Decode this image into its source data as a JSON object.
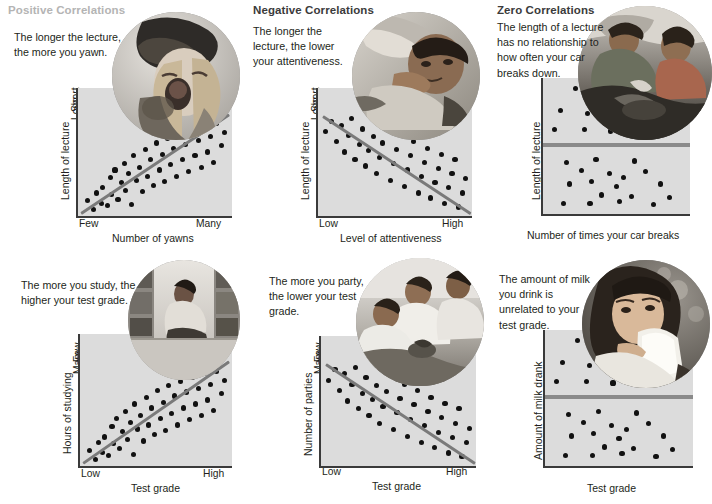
{
  "headings": [
    {
      "id": "positive",
      "label": "Positive Correlations",
      "tone": "faded"
    },
    {
      "id": "negative",
      "label": "Negative Correlations",
      "tone": "dark"
    },
    {
      "id": "zero",
      "label": "Zero Correlations",
      "tone": "dark"
    }
  ],
  "panels": [
    {
      "id": "positive-lecture-yawn",
      "heading": "Positive Correlations",
      "caption": "The longer the lecture, the more you yawn.",
      "photo_alt": "woman yawning wearing a knit hat",
      "chart": {
        "type": "scatter",
        "xlabel": "Number of yawns",
        "ylabel": "Length of lecture",
        "xticks": [
          "Few",
          "Many"
        ],
        "yticks": [
          "Short",
          "Long"
        ],
        "trend": "positive",
        "trend_line": {
          "x1": 0.02,
          "y1": 0.03,
          "x2": 0.98,
          "y2": 0.8
        }
      }
    },
    {
      "id": "negative-lecture-attentiveness",
      "heading": "Negative Correlations",
      "caption": "The longer the lecture, the lower your attentiveness.",
      "photo_alt": "student asleep on desk in class",
      "chart": {
        "type": "scatter",
        "xlabel": "Level of attentiveness",
        "ylabel": "Length of lecture",
        "xticks": [
          "Low",
          "High"
        ],
        "yticks": [
          "Short",
          "Long"
        ],
        "trend": "negative",
        "trend_line": {
          "x1": 0.03,
          "y1": 0.79,
          "x2": 0.99,
          "y2": 0.03
        }
      }
    },
    {
      "id": "zero-lecture-car",
      "heading": "Zero Correlations",
      "caption": "The length of a lecture has no relationship to how often your car breaks down.",
      "photo_alt": "two people repairing a car engine",
      "chart": {
        "type": "scatter",
        "xlabel": "Number of times your car breaks",
        "ylabel": "Length of lecture",
        "xticks": [],
        "yticks": [],
        "trend": "zero",
        "trend_line": {
          "y": 0.52
        }
      }
    },
    {
      "id": "positive-study-grade",
      "heading": "Positive Correlations",
      "caption": "The more you study, the higher your test grade.",
      "photo_alt": "student reading in a library aisle",
      "chart": {
        "type": "scatter",
        "xlabel": "Test grade",
        "ylabel": "Hours of studying",
        "xticks": [
          "Low",
          "High"
        ],
        "yticks": [
          "Few",
          "Many"
        ],
        "trend": "positive",
        "trend_line": {
          "x1": 0.02,
          "y1": 0.03,
          "x2": 0.98,
          "y2": 0.8
        }
      }
    },
    {
      "id": "negative-party-grade",
      "heading": "Negative Correlations",
      "caption": "The more you party, the lower your test grade.",
      "photo_alt": "three friends at a party",
      "chart": {
        "type": "scatter",
        "xlabel": "Test grade",
        "ylabel": "Number of parties",
        "xticks": [
          "Low",
          "High"
        ],
        "yticks": [
          "Few",
          "Many"
        ],
        "trend": "negative",
        "trend_line": {
          "x1": 0.03,
          "y1": 0.79,
          "x2": 0.99,
          "y2": 0.03
        }
      }
    },
    {
      "id": "zero-milk-grade",
      "heading": "Zero Correlations",
      "caption": "The amount of milk you drink is unrelated to your test grade.",
      "photo_alt": "woman drinking a glass of milk",
      "chart": {
        "type": "scatter",
        "xlabel": "Test grade",
        "ylabel": "Amount of milk drank",
        "xticks": [],
        "yticks": [],
        "trend": "zero",
        "trend_line": {
          "y": 0.52
        }
      }
    }
  ],
  "colors": {
    "plot_background": "#dcdcdc",
    "axis": "#3a3a3a",
    "dot": "#111111",
    "trend_line": "#7a7a7a",
    "heading_dark": "#3b3b3b",
    "heading_faded": "#b4b4b4",
    "text": "#231f20"
  },
  "chart_data": [
    {
      "id": "positive-lecture-yawn",
      "type": "scatter",
      "title": "Positive Correlations",
      "xlabel": "Number of yawns",
      "ylabel": "Length of lecture",
      "xticklabels": [
        "Few",
        "Many"
      ],
      "yticklabels": [
        "Short",
        "Long"
      ],
      "xlim": [
        0,
        1
      ],
      "ylim": [
        0,
        1
      ],
      "grid": false,
      "trendline": {
        "type": "positive",
        "points": [
          [
            0.02,
            0.03
          ],
          [
            0.98,
            0.8
          ]
        ]
      },
      "points": [
        [
          0.06,
          0.12
        ],
        [
          0.1,
          0.05
        ],
        [
          0.12,
          0.18
        ],
        [
          0.15,
          0.1
        ],
        [
          0.16,
          0.22
        ],
        [
          0.19,
          0.08
        ],
        [
          0.21,
          0.3
        ],
        [
          0.22,
          0.17
        ],
        [
          0.24,
          0.36
        ],
        [
          0.26,
          0.13
        ],
        [
          0.28,
          0.26
        ],
        [
          0.3,
          0.41
        ],
        [
          0.31,
          0.2
        ],
        [
          0.33,
          0.33
        ],
        [
          0.35,
          0.09
        ],
        [
          0.36,
          0.47
        ],
        [
          0.38,
          0.28
        ],
        [
          0.4,
          0.38
        ],
        [
          0.42,
          0.19
        ],
        [
          0.44,
          0.52
        ],
        [
          0.45,
          0.31
        ],
        [
          0.47,
          0.44
        ],
        [
          0.49,
          0.24
        ],
        [
          0.51,
          0.57
        ],
        [
          0.53,
          0.36
        ],
        [
          0.55,
          0.48
        ],
        [
          0.56,
          0.27
        ],
        [
          0.58,
          0.61
        ],
        [
          0.6,
          0.4
        ],
        [
          0.62,
          0.53
        ],
        [
          0.64,
          0.31
        ],
        [
          0.66,
          0.64
        ],
        [
          0.68,
          0.44
        ],
        [
          0.7,
          0.56
        ],
        [
          0.72,
          0.35
        ],
        [
          0.74,
          0.67
        ],
        [
          0.76,
          0.47
        ],
        [
          0.78,
          0.59
        ],
        [
          0.8,
          0.38
        ],
        [
          0.82,
          0.7
        ],
        [
          0.84,
          0.5
        ],
        [
          0.86,
          0.62
        ],
        [
          0.88,
          0.42
        ],
        [
          0.9,
          0.72
        ],
        [
          0.93,
          0.55
        ],
        [
          0.95,
          0.65
        ]
      ]
    },
    {
      "id": "negative-lecture-attentiveness",
      "type": "scatter",
      "title": "Negative Correlations",
      "xlabel": "Level of attentiveness",
      "ylabel": "Length of lecture",
      "xticklabels": [
        "Low",
        "High"
      ],
      "yticklabels": [
        "Short",
        "Long"
      ],
      "xlim": [
        0,
        1
      ],
      "ylim": [
        0,
        1
      ],
      "grid": false,
      "trendline": {
        "type": "negative",
        "points": [
          [
            0.03,
            0.79
          ],
          [
            0.99,
            0.03
          ]
        ]
      },
      "points": [
        [
          0.05,
          0.66
        ],
        [
          0.09,
          0.74
        ],
        [
          0.12,
          0.58
        ],
        [
          0.15,
          0.71
        ],
        [
          0.17,
          0.5
        ],
        [
          0.2,
          0.63
        ],
        [
          0.22,
          0.76
        ],
        [
          0.24,
          0.44
        ],
        [
          0.27,
          0.56
        ],
        [
          0.29,
          0.68
        ],
        [
          0.31,
          0.39
        ],
        [
          0.33,
          0.51
        ],
        [
          0.36,
          0.62
        ],
        [
          0.38,
          0.33
        ],
        [
          0.4,
          0.46
        ],
        [
          0.42,
          0.57
        ],
        [
          0.45,
          0.7
        ],
        [
          0.47,
          0.28
        ],
        [
          0.49,
          0.41
        ],
        [
          0.51,
          0.52
        ],
        [
          0.54,
          0.63
        ],
        [
          0.56,
          0.23
        ],
        [
          0.58,
          0.36
        ],
        [
          0.6,
          0.47
        ],
        [
          0.62,
          0.58
        ],
        [
          0.65,
          0.18
        ],
        [
          0.67,
          0.31
        ],
        [
          0.69,
          0.42
        ],
        [
          0.71,
          0.53
        ],
        [
          0.73,
          0.14
        ],
        [
          0.76,
          0.26
        ],
        [
          0.78,
          0.37
        ],
        [
          0.8,
          0.48
        ],
        [
          0.82,
          0.1
        ],
        [
          0.85,
          0.22
        ],
        [
          0.87,
          0.33
        ],
        [
          0.89,
          0.44
        ],
        [
          0.91,
          0.07
        ],
        [
          0.94,
          0.18
        ],
        [
          0.96,
          0.29
        ]
      ]
    },
    {
      "id": "zero-lecture-car",
      "type": "scatter",
      "title": "Zero Correlations",
      "xlabel": "Number of times your car breaks",
      "ylabel": "Length of lecture",
      "xticklabels": [],
      "yticklabels": [],
      "xlim": [
        0,
        1
      ],
      "ylim": [
        0,
        1
      ],
      "grid": false,
      "trendline": {
        "type": "zero",
        "y": 0.52
      },
      "points": [
        [
          0.08,
          0.62
        ],
        [
          0.22,
          0.92
        ],
        [
          0.12,
          0.76
        ],
        [
          0.3,
          0.74
        ],
        [
          0.28,
          0.62
        ],
        [
          0.46,
          0.61
        ],
        [
          0.16,
          0.38
        ],
        [
          0.36,
          0.4
        ],
        [
          0.26,
          0.32
        ],
        [
          0.45,
          0.3
        ],
        [
          0.62,
          0.39
        ],
        [
          0.55,
          0.27
        ],
        [
          0.18,
          0.22
        ],
        [
          0.33,
          0.24
        ],
        [
          0.5,
          0.2
        ],
        [
          0.7,
          0.31
        ],
        [
          0.4,
          0.14
        ],
        [
          0.6,
          0.13
        ],
        [
          0.8,
          0.22
        ],
        [
          0.14,
          0.08
        ],
        [
          0.32,
          0.08
        ],
        [
          0.52,
          0.09
        ],
        [
          0.75,
          0.07
        ],
        [
          0.86,
          0.12
        ]
      ]
    },
    {
      "id": "positive-study-grade",
      "type": "scatter",
      "title": "Positive Correlations",
      "xlabel": "Test grade",
      "ylabel": "Hours of studying",
      "xticklabels": [
        "Low",
        "High"
      ],
      "yticklabels": [
        "Few",
        "Many"
      ],
      "xlim": [
        0,
        1
      ],
      "ylim": [
        0,
        1
      ],
      "grid": false,
      "trendline": {
        "type": "positive",
        "points": [
          [
            0.02,
            0.03
          ],
          [
            0.98,
            0.8
          ]
        ]
      },
      "points": [
        [
          0.06,
          0.12
        ],
        [
          0.1,
          0.05
        ],
        [
          0.12,
          0.18
        ],
        [
          0.15,
          0.1
        ],
        [
          0.16,
          0.22
        ],
        [
          0.19,
          0.08
        ],
        [
          0.21,
          0.3
        ],
        [
          0.22,
          0.17
        ],
        [
          0.24,
          0.36
        ],
        [
          0.26,
          0.13
        ],
        [
          0.28,
          0.26
        ],
        [
          0.3,
          0.41
        ],
        [
          0.31,
          0.2
        ],
        [
          0.33,
          0.33
        ],
        [
          0.35,
          0.09
        ],
        [
          0.36,
          0.47
        ],
        [
          0.38,
          0.28
        ],
        [
          0.4,
          0.38
        ],
        [
          0.42,
          0.19
        ],
        [
          0.44,
          0.52
        ],
        [
          0.45,
          0.31
        ],
        [
          0.47,
          0.44
        ],
        [
          0.49,
          0.24
        ],
        [
          0.51,
          0.57
        ],
        [
          0.53,
          0.36
        ],
        [
          0.55,
          0.48
        ],
        [
          0.56,
          0.27
        ],
        [
          0.58,
          0.61
        ],
        [
          0.6,
          0.4
        ],
        [
          0.62,
          0.53
        ],
        [
          0.64,
          0.31
        ],
        [
          0.66,
          0.64
        ],
        [
          0.68,
          0.44
        ],
        [
          0.7,
          0.56
        ],
        [
          0.72,
          0.35
        ],
        [
          0.74,
          0.67
        ],
        [
          0.76,
          0.47
        ],
        [
          0.78,
          0.59
        ],
        [
          0.8,
          0.38
        ],
        [
          0.82,
          0.7
        ],
        [
          0.84,
          0.5
        ],
        [
          0.86,
          0.62
        ],
        [
          0.88,
          0.42
        ],
        [
          0.9,
          0.72
        ],
        [
          0.93,
          0.55
        ],
        [
          0.95,
          0.65
        ]
      ]
    },
    {
      "id": "negative-party-grade",
      "type": "scatter",
      "title": "Negative Correlations",
      "xlabel": "Test grade",
      "ylabel": "Number of parties",
      "xticklabels": [
        "Low",
        "High"
      ],
      "yticklabels": [
        "Few",
        "Many"
      ],
      "xlim": [
        0,
        1
      ],
      "ylim": [
        0,
        1
      ],
      "grid": false,
      "trendline": {
        "type": "negative",
        "points": [
          [
            0.03,
            0.79
          ],
          [
            0.99,
            0.03
          ]
        ]
      },
      "points": [
        [
          0.05,
          0.66
        ],
        [
          0.09,
          0.74
        ],
        [
          0.12,
          0.58
        ],
        [
          0.15,
          0.71
        ],
        [
          0.17,
          0.5
        ],
        [
          0.2,
          0.63
        ],
        [
          0.22,
          0.76
        ],
        [
          0.24,
          0.44
        ],
        [
          0.27,
          0.56
        ],
        [
          0.29,
          0.68
        ],
        [
          0.31,
          0.39
        ],
        [
          0.33,
          0.51
        ],
        [
          0.36,
          0.62
        ],
        [
          0.38,
          0.33
        ],
        [
          0.4,
          0.46
        ],
        [
          0.42,
          0.57
        ],
        [
          0.45,
          0.7
        ],
        [
          0.47,
          0.28
        ],
        [
          0.49,
          0.41
        ],
        [
          0.51,
          0.52
        ],
        [
          0.54,
          0.63
        ],
        [
          0.56,
          0.23
        ],
        [
          0.58,
          0.36
        ],
        [
          0.6,
          0.47
        ],
        [
          0.62,
          0.58
        ],
        [
          0.65,
          0.18
        ],
        [
          0.67,
          0.31
        ],
        [
          0.69,
          0.42
        ],
        [
          0.71,
          0.53
        ],
        [
          0.73,
          0.14
        ],
        [
          0.76,
          0.26
        ],
        [
          0.78,
          0.37
        ],
        [
          0.8,
          0.48
        ],
        [
          0.82,
          0.1
        ],
        [
          0.85,
          0.22
        ],
        [
          0.87,
          0.33
        ],
        [
          0.89,
          0.44
        ],
        [
          0.91,
          0.07
        ],
        [
          0.94,
          0.18
        ],
        [
          0.96,
          0.29
        ]
      ]
    },
    {
      "id": "zero-milk-grade",
      "type": "scatter",
      "title": "Zero Correlations",
      "xlabel": "Test grade",
      "ylabel": "Amount of milk drank",
      "xticklabels": [],
      "yticklabels": [],
      "xlim": [
        0,
        1
      ],
      "ylim": [
        0,
        1
      ],
      "grid": false,
      "trendline": {
        "type": "zero",
        "y": 0.52
      },
      "points": [
        [
          0.08,
          0.62
        ],
        [
          0.22,
          0.92
        ],
        [
          0.12,
          0.76
        ],
        [
          0.3,
          0.74
        ],
        [
          0.28,
          0.62
        ],
        [
          0.46,
          0.61
        ],
        [
          0.16,
          0.38
        ],
        [
          0.36,
          0.4
        ],
        [
          0.26,
          0.32
        ],
        [
          0.45,
          0.3
        ],
        [
          0.62,
          0.39
        ],
        [
          0.55,
          0.27
        ],
        [
          0.18,
          0.22
        ],
        [
          0.33,
          0.24
        ],
        [
          0.5,
          0.2
        ],
        [
          0.7,
          0.31
        ],
        [
          0.4,
          0.14
        ],
        [
          0.6,
          0.13
        ],
        [
          0.8,
          0.22
        ],
        [
          0.14,
          0.08
        ],
        [
          0.32,
          0.08
        ],
        [
          0.52,
          0.09
        ],
        [
          0.75,
          0.07
        ],
        [
          0.86,
          0.12
        ]
      ]
    }
  ]
}
